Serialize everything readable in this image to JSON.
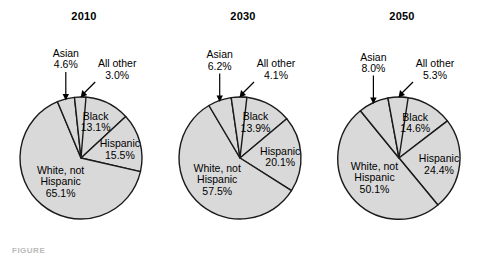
{
  "figure": {
    "caption_partial": "FIGURE",
    "slice_fill": "#d9d9d9",
    "slice_stroke": "#1a1a1a",
    "background": "#ffffff"
  },
  "chart_data": {
    "type": "pie",
    "title": "",
    "panels": [
      {
        "title": "2010",
        "categories": [
          "Black",
          "Hispanic",
          "White, not Hispanic",
          "Asian",
          "All other"
        ],
        "values": [
          13.1,
          15.5,
          65.1,
          4.6,
          3.0
        ],
        "labels": [
          {
            "name": "Black",
            "line1": "Black",
            "line2": "13.1%",
            "value": 13.1,
            "placement": "inside"
          },
          {
            "name": "Hispanic",
            "line1": "Hispanic",
            "line2": "15.5%",
            "value": 15.5,
            "placement": "inside"
          },
          {
            "name": "White, not Hispanic",
            "line1": "White, not",
            "line2": "Hispanic",
            "line3": "65.1%",
            "value": 65.1,
            "placement": "inside"
          },
          {
            "name": "Asian",
            "line1": "Asian",
            "line2": "4.6%",
            "value": 4.6,
            "placement": "callout"
          },
          {
            "name": "All other",
            "line1": "All other",
            "line2": "3.0%",
            "value": 3.0,
            "placement": "callout"
          }
        ]
      },
      {
        "title": "2030",
        "categories": [
          "Black",
          "Hispanic",
          "White, not Hispanic",
          "Asian",
          "All other"
        ],
        "values": [
          13.9,
          20.1,
          57.5,
          6.2,
          4.1
        ],
        "labels": [
          {
            "name": "Black",
            "line1": "Black",
            "line2": "13.9%",
            "value": 13.9,
            "placement": "inside"
          },
          {
            "name": "Hispanic",
            "line1": "Hispanic",
            "line2": "20.1%",
            "value": 20.1,
            "placement": "inside"
          },
          {
            "name": "White, not Hispanic",
            "line1": "White, not",
            "line2": "Hispanic",
            "line3": "57.5%",
            "value": 57.5,
            "placement": "inside"
          },
          {
            "name": "Asian",
            "line1": "Asian",
            "line2": "6.2%",
            "value": 6.2,
            "placement": "callout"
          },
          {
            "name": "All other",
            "line1": "All other",
            "line2": "4.1%",
            "value": 4.1,
            "placement": "callout"
          }
        ]
      },
      {
        "title": "2050",
        "categories": [
          "Black",
          "Hispanic",
          "White, not Hispanic",
          "Asian",
          "All other"
        ],
        "values": [
          14.6,
          24.4,
          50.1,
          8.0,
          5.3
        ],
        "labels": [
          {
            "name": "Black",
            "line1": "Black",
            "line2": "14.6%",
            "value": 14.6,
            "placement": "inside"
          },
          {
            "name": "Hispanic",
            "line1": "Hispanic",
            "line2": "24.4%",
            "value": 24.4,
            "placement": "inside"
          },
          {
            "name": "White, not Hispanic",
            "line1": "White, not",
            "line2": "Hispanic",
            "line3": "50.1%",
            "value": 50.1,
            "placement": "inside"
          },
          {
            "name": "Asian",
            "line1": "Asian",
            "line2": "8.0%",
            "value": 8.0,
            "placement": "callout"
          },
          {
            "name": "All other",
            "line1": "All other",
            "line2": "5.3%",
            "value": 5.3,
            "placement": "callout"
          }
        ]
      }
    ]
  }
}
